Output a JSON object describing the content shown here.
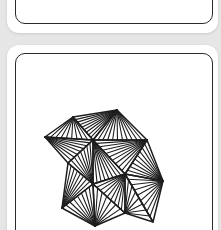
{
  "colors": {
    "background": "#e6e6e6",
    "tile": "#ffffff",
    "ink": "#1e1e1e"
  },
  "tiles": [
    {
      "name": "top-tile",
      "content": "empty"
    },
    {
      "name": "bottom-tile",
      "content": "tangle-drawing"
    }
  ],
  "drawing": {
    "description": "Zentangle-style cluster of triangles, each filled with fan lines radiating from one vertex",
    "vertices": {
      "A": [
        45,
        137
      ],
      "B": [
        73,
        117
      ],
      "C": [
        117,
        110
      ],
      "D": [
        93,
        140
      ],
      "E": [
        147,
        140
      ],
      "F": [
        163,
        181
      ],
      "G": [
        68,
        163
      ],
      "H": [
        93,
        184
      ],
      "N": [
        125,
        174
      ],
      "J": [
        62,
        208
      ],
      "K": [
        95,
        226
      ],
      "L": [
        125,
        213
      ],
      "M": [
        153,
        222
      ]
    },
    "triangles": [
      {
        "apex": "B",
        "base": [
          "A",
          "D"
        ],
        "lines": 9
      },
      {
        "apex": "C",
        "base": [
          "B",
          "D"
        ],
        "lines": 9
      },
      {
        "apex": "A",
        "base": [
          "D",
          "G"
        ],
        "lines": 8
      },
      {
        "apex": "C",
        "base": [
          "D",
          "E"
        ],
        "lines": 11
      },
      {
        "apex": "E",
        "base": [
          "D",
          "N"
        ],
        "lines": 10
      },
      {
        "apex": "D",
        "base": [
          "N",
          "H"
        ],
        "lines": 8
      },
      {
        "apex": "H",
        "base": [
          "D",
          "G"
        ],
        "lines": 8
      },
      {
        "apex": "F",
        "base": [
          "E",
          "N"
        ],
        "lines": 9
      },
      {
        "apex": "J",
        "base": [
          "G",
          "H"
        ],
        "lines": 8
      },
      {
        "apex": "K",
        "base": [
          "J",
          "H"
        ],
        "lines": 8
      },
      {
        "apex": "N",
        "base": [
          "H",
          "L"
        ],
        "lines": 9
      },
      {
        "apex": "K",
        "base": [
          "H",
          "L"
        ],
        "lines": 7
      },
      {
        "apex": "F",
        "base": [
          "N",
          "M"
        ],
        "lines": 9
      },
      {
        "apex": "L",
        "base": [
          "N",
          "M"
        ],
        "lines": 8
      }
    ]
  }
}
